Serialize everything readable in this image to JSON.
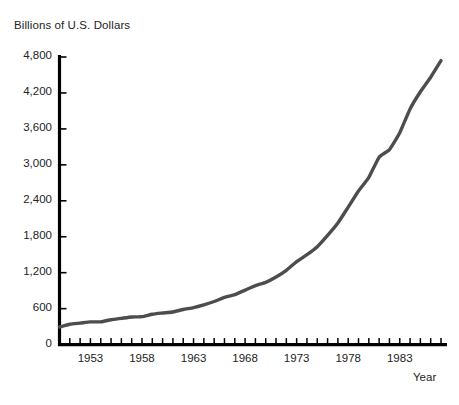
{
  "chart_data": {
    "type": "line",
    "title": "Billions of U.S. Dollars",
    "xlabel": "Year",
    "ylabel": "Billions of U.S. Dollars",
    "xlim": [
      1950,
      1987
    ],
    "ylim": [
      0,
      4800
    ],
    "grid": false,
    "legend": "none",
    "line_color": "#4d4d4d",
    "axis_color": "#000000",
    "background_color": "#ffffff",
    "y_ticks": [
      0,
      600,
      1200,
      1800,
      2400,
      3000,
      3600,
      4200,
      4800
    ],
    "y_tick_labels": [
      "0",
      "600",
      "1,200",
      "1,800",
      "2,400",
      "3,000",
      "3,600",
      "4,200",
      "4,800"
    ],
    "x_tick_labels": [
      "1953",
      "1958",
      "1963",
      "1968",
      "1973",
      "1978",
      "1983"
    ],
    "x_tick_label_values": [
      1953,
      1958,
      1963,
      1968,
      1973,
      1978,
      1983
    ],
    "x_tick_interval": 1,
    "x": [
      1950,
      1951,
      1952,
      1953,
      1954,
      1955,
      1956,
      1957,
      1958,
      1959,
      1960,
      1961,
      1962,
      1963,
      1964,
      1965,
      1966,
      1967,
      1968,
      1969,
      1970,
      1971,
      1972,
      1973,
      1974,
      1975,
      1976,
      1977,
      1978,
      1979,
      1980,
      1981,
      1982,
      1983,
      1984,
      1985,
      1986,
      1987
    ],
    "values": [
      294,
      339,
      358,
      379,
      380,
      415,
      438,
      461,
      467,
      507,
      527,
      545,
      586,
      618,
      664,
      719,
      788,
      833,
      910,
      985,
      1039,
      1128,
      1240,
      1385,
      1501,
      1635,
      1824,
      2031,
      2295,
      2563,
      2790,
      3128,
      3255,
      3536,
      3933,
      4220,
      4463,
      4739
    ],
    "series": [
      {
        "name": "Gross National Product",
        "values": [
          294,
          339,
          358,
          379,
          380,
          415,
          438,
          461,
          467,
          507,
          527,
          545,
          586,
          618,
          664,
          719,
          788,
          833,
          910,
          985,
          1039,
          1128,
          1240,
          1385,
          1501,
          1635,
          1824,
          2031,
          2295,
          2563,
          2790,
          3128,
          3255,
          3536,
          3933,
          4220,
          4463,
          4739
        ]
      }
    ]
  },
  "axes": {
    "title": "Billions of U.S. Dollars",
    "x_axis_caption": "Year"
  }
}
